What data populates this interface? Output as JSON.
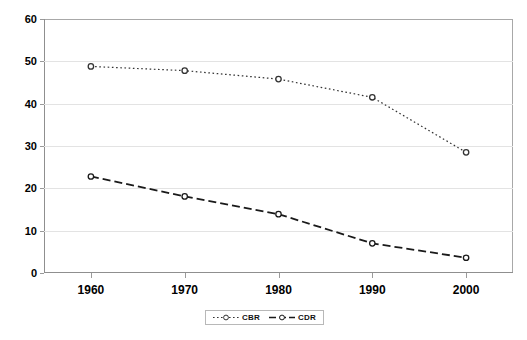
{
  "chart_data": {
    "type": "line",
    "title": "",
    "xlabel": "",
    "ylabel": "",
    "categories": [
      "1960",
      "1970",
      "1980",
      "1990",
      "2000"
    ],
    "x": [
      1960,
      1970,
      1980,
      1990,
      2000
    ],
    "xlim": [
      1955,
      2005
    ],
    "ylim": [
      0,
      60
    ],
    "y_ticks": [
      "0",
      "10",
      "20",
      "30",
      "40",
      "50",
      "60"
    ],
    "y_tick_values": [
      0,
      10,
      20,
      30,
      40,
      50,
      60
    ],
    "grid": true,
    "legend_position": "bottom-center",
    "series": [
      {
        "name": "CBR",
        "values": [
          48.8,
          47.8,
          45.8,
          41.5,
          28.5
        ],
        "line_style": "dotted",
        "marker": "open-circle",
        "color": "#333333"
      },
      {
        "name": "CDR",
        "values": [
          22.8,
          18.1,
          13.9,
          7.0,
          3.6
        ],
        "line_style": "dashed",
        "marker": "open-circle",
        "color": "#1a1a1a"
      }
    ]
  },
  "legend": {
    "items": [
      {
        "label": "CBR"
      },
      {
        "label": "CDR"
      }
    ]
  }
}
